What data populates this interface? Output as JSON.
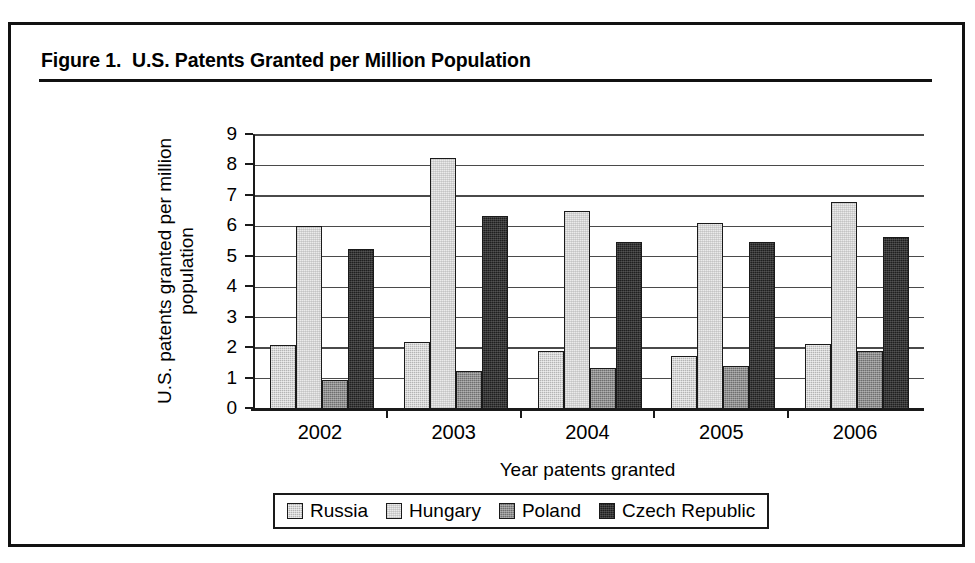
{
  "figure": {
    "title": "Figure 1.  U.S. Patents Granted per Million Population"
  },
  "chart_data": {
    "type": "bar",
    "title": "U.S. Patents Granted per Million Population",
    "xlabel": "Year patents granted",
    "ylabel": "U.S. patents granted per million population",
    "categories": [
      "2002",
      "2003",
      "2004",
      "2005",
      "2006"
    ],
    "ylim": [
      0,
      9
    ],
    "yticks": [
      "0",
      "1",
      "2",
      "3",
      "4",
      "5",
      "6",
      "7",
      "8",
      "9"
    ],
    "grid": true,
    "legend_position": "bottom",
    "series": [
      {
        "name": "Russia",
        "color": "#b4b4b4",
        "values": [
          2.1,
          2.2,
          1.9,
          1.75,
          2.15
        ]
      },
      {
        "name": "Hungary",
        "color": "#ebebeb",
        "values": [
          6.0,
          8.25,
          6.5,
          6.1,
          6.8
        ]
      },
      {
        "name": "Poland",
        "color": "#6e6e6e",
        "values": [
          0.95,
          1.25,
          1.35,
          1.4,
          1.9
        ]
      },
      {
        "name": "Czech Republic",
        "color": "#1f1f1f",
        "values": [
          5.25,
          6.35,
          5.5,
          5.5,
          5.65
        ]
      }
    ]
  }
}
